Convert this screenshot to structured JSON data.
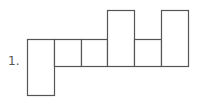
{
  "problem": {
    "number_label": "1.",
    "description": "Net of a rectangular prism: a row of six faces with one face extended downward on the left and two faces extended upward"
  },
  "diagram": {
    "stroke_color": "#555555",
    "fill_color": "#ffffff",
    "rects": [
      {
        "name": "face-left-tall",
        "x": 27,
        "y": 39,
        "w": 27,
        "h": 56
      },
      {
        "name": "face-2",
        "x": 54,
        "y": 39,
        "w": 27,
        "h": 27
      },
      {
        "name": "face-3",
        "x": 81,
        "y": 39,
        "w": 26,
        "h": 27
      },
      {
        "name": "face-4-tall",
        "x": 107,
        "y": 10,
        "w": 27,
        "h": 56
      },
      {
        "name": "face-5",
        "x": 134,
        "y": 39,
        "w": 27,
        "h": 27
      },
      {
        "name": "face-6-tall",
        "x": 161,
        "y": 10,
        "w": 27,
        "h": 56
      }
    ]
  }
}
